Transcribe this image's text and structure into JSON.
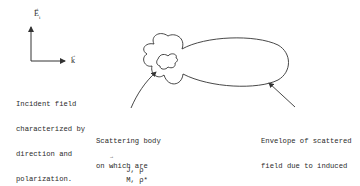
{
  "diagram": {
    "axes": {
      "vertical_label": "E",
      "vertical_subscript": "i",
      "horizontal_label": "k"
    },
    "labels": {
      "incident": [
        "Incident field",
        "characterized by",
        "direction and",
        "polarization."
      ],
      "scattering_body": [
        "Scattering body",
        "on which are",
        "induced currents",
        "and charges:"
      ],
      "sources_electric": "J, ρ",
      "sources_magnetic": "M, ρ*",
      "envelope": [
        "Envelope of scattered",
        "field due to induced",
        "sources on scatterer."
      ]
    },
    "colors": {
      "stroke": "#333333",
      "text": "#2a2a2a",
      "background": "#ffffff"
    }
  }
}
